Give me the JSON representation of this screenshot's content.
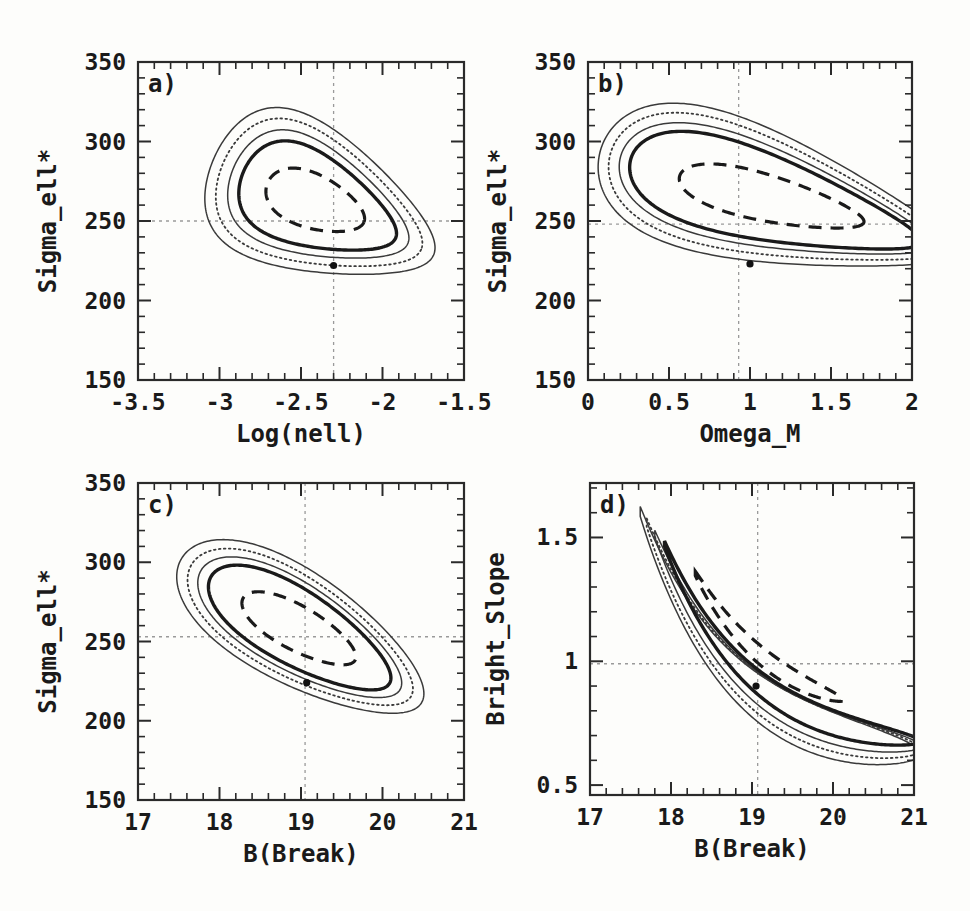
{
  "figure": {
    "kind": "multi-panel-contour-figure",
    "panels": 4,
    "background": "#fdfdfb",
    "ink": "#1a1a1a"
  },
  "chart_data": [
    {
      "type": "line",
      "panel": "a",
      "panel_label": "a)",
      "title": "",
      "xlabel": "Log(nell)",
      "ylabel": "Sigma_ell*",
      "xlim": [
        -3.5,
        -1.5
      ],
      "ylim": [
        150,
        350
      ],
      "xticks": [
        -3.5,
        -3,
        -2.5,
        -2,
        -1.5
      ],
      "xticklabels": [
        "-3.5",
        "-3",
        "-2.5",
        "-2",
        "-1.5"
      ],
      "yticks": [
        150,
        200,
        250,
        300,
        350
      ],
      "yticklabels": [
        "150",
        "200",
        "250",
        "300",
        "350"
      ],
      "xminor_per_major": 5,
      "yminor_per_major": 5,
      "grid": false,
      "legend": "none",
      "crosshair": {
        "x": -2.3,
        "y": 250,
        "style": "dotted"
      },
      "best_fit_marker": {
        "x": -2.3,
        "y": 222
      },
      "contours": [
        {
          "name": "outer-solid-thin",
          "style": "solid-thin",
          "level": "outermost"
        },
        {
          "name": "dotted",
          "style": "dotted",
          "level": "second"
        },
        {
          "name": "inner-solid-thin",
          "style": "solid-thin",
          "level": "third"
        },
        {
          "name": "solid-thick",
          "style": "solid-thick",
          "level": "fourth"
        },
        {
          "name": "dashed",
          "style": "dashed",
          "level": "innermost"
        }
      ]
    },
    {
      "type": "line",
      "panel": "b",
      "panel_label": "b)",
      "title": "",
      "xlabel": "Omega_M",
      "ylabel": "Sigma_ell*",
      "xlim": [
        0,
        2
      ],
      "ylim": [
        150,
        350
      ],
      "xticks": [
        0,
        0.5,
        1,
        1.5,
        2
      ],
      "xticklabels": [
        "0",
        "0.5",
        "1",
        "1.5",
        "2"
      ],
      "yticks": [
        150,
        200,
        250,
        300,
        350
      ],
      "yticklabels": [
        "150",
        "200",
        "250",
        "300",
        "350"
      ],
      "xminor_per_major": 5,
      "yminor_per_major": 5,
      "grid": false,
      "legend": "none",
      "crosshair": {
        "x": 0.93,
        "y": 248,
        "style": "dotted"
      },
      "best_fit_marker": {
        "x": 1.0,
        "y": 223
      },
      "contours": [
        {
          "name": "outer-solid-thin",
          "style": "solid-thin",
          "level": "outermost"
        },
        {
          "name": "dotted",
          "style": "dotted",
          "level": "second"
        },
        {
          "name": "inner-solid-thin",
          "style": "solid-thin",
          "level": "third"
        },
        {
          "name": "solid-thick",
          "style": "solid-thick",
          "level": "fourth"
        },
        {
          "name": "dashed",
          "style": "dashed",
          "level": "innermost"
        }
      ]
    },
    {
      "type": "line",
      "panel": "c",
      "panel_label": "c)",
      "title": "",
      "xlabel": "B(Break)",
      "ylabel": "Sigma_ell*",
      "xlim": [
        17,
        21
      ],
      "ylim": [
        150,
        350
      ],
      "xticks": [
        17,
        18,
        19,
        20,
        21
      ],
      "xticklabels": [
        "17",
        "18",
        "19",
        "20",
        "21"
      ],
      "yticks": [
        150,
        200,
        250,
        300,
        350
      ],
      "yticklabels": [
        "150",
        "200",
        "250",
        "300",
        "350"
      ],
      "xminor_per_major": 5,
      "yminor_per_major": 5,
      "grid": false,
      "legend": "none",
      "crosshair": {
        "x": 19.05,
        "y": 253,
        "style": "dotted"
      },
      "best_fit_marker": {
        "x": 19.07,
        "y": 224
      },
      "contours": [
        {
          "name": "outer-solid-thin",
          "style": "solid-thin",
          "level": "outermost"
        },
        {
          "name": "dotted",
          "style": "dotted",
          "level": "second"
        },
        {
          "name": "inner-solid-thin",
          "style": "solid-thin",
          "level": "third"
        },
        {
          "name": "solid-thick",
          "style": "solid-thick",
          "level": "fourth"
        },
        {
          "name": "dashed",
          "style": "dashed",
          "level": "innermost"
        }
      ]
    },
    {
      "type": "line",
      "panel": "d",
      "panel_label": "d)",
      "title": "",
      "xlabel": "B(Break)",
      "ylabel": "Bright_Slope",
      "xlim": [
        17,
        21
      ],
      "ylim": [
        0.46,
        1.72
      ],
      "xticks": [
        17,
        18,
        19,
        20,
        21
      ],
      "xticklabels": [
        "17",
        "18",
        "19",
        "20",
        "21"
      ],
      "yticks": [
        0.5,
        1,
        1.5
      ],
      "yticklabels": [
        "0.5",
        "1",
        "1.5"
      ],
      "xminor_per_major": 5,
      "yminor_per_major": 5,
      "grid": false,
      "legend": "none",
      "crosshair": {
        "x": 19.07,
        "y": 0.99,
        "style": "dotted"
      },
      "best_fit_marker": {
        "x": 19.05,
        "y": 0.9
      },
      "contours": [
        {
          "name": "outer-solid-thin",
          "style": "solid-thin",
          "level": "outermost"
        },
        {
          "name": "dotted",
          "style": "dotted",
          "level": "second"
        },
        {
          "name": "inner-solid-thin",
          "style": "solid-thin",
          "level": "third"
        },
        {
          "name": "solid-thick",
          "style": "solid-thick",
          "level": "fourth"
        },
        {
          "name": "dashed",
          "style": "dashed",
          "level": "innermost"
        }
      ]
    }
  ]
}
